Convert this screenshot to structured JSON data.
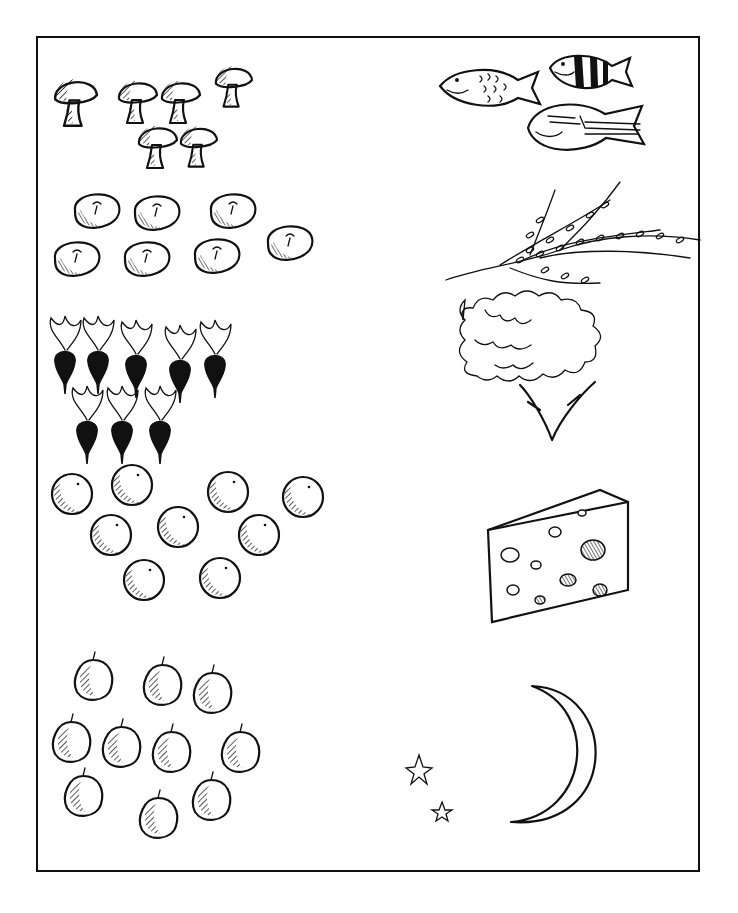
{
  "worksheet": {
    "title": "Counting picture worksheet",
    "ink_color": "#111111",
    "paper_color": "#ffffff",
    "left_column": [
      {
        "id": "mushrooms",
        "item": "mushroom",
        "count": 6,
        "positions": [
          [
            75,
            95
          ],
          [
            137,
            95
          ],
          [
            180,
            95
          ],
          [
            233,
            80
          ],
          [
            157,
            140
          ],
          [
            198,
            140
          ]
        ],
        "scale": [
          1.1,
          1.0,
          1.0,
          0.95,
          1.0,
          0.95
        ]
      },
      {
        "id": "tomatoes",
        "item": "tomato",
        "count": 8,
        "positions": [
          [
            97,
            210
          ],
          [
            157,
            212
          ],
          [
            233,
            210
          ],
          [
            77,
            258
          ],
          [
            147,
            258
          ],
          [
            217,
            255
          ],
          [
            290,
            242
          ]
        ]
      },
      {
        "id": "radishes",
        "item": "radish",
        "count": 8,
        "positions": [
          [
            65,
            358
          ],
          [
            98,
            358
          ],
          [
            136,
            362
          ],
          [
            180,
            367
          ],
          [
            215,
            362
          ],
          [
            87,
            428
          ],
          [
            122,
            428
          ],
          [
            160,
            428
          ]
        ]
      },
      {
        "id": "oranges",
        "item": "orange",
        "count": 9,
        "positions": [
          [
            72,
            494
          ],
          [
            132,
            485
          ],
          [
            228,
            492
          ],
          [
            303,
            497
          ],
          [
            111,
            535
          ],
          [
            178,
            527
          ],
          [
            259,
            535
          ],
          [
            144,
            580
          ],
          [
            220,
            578
          ]
        ]
      },
      {
        "id": "plums",
        "item": "plum",
        "count": 11,
        "positions": [
          [
            93,
            680
          ],
          [
            162,
            685
          ],
          [
            212,
            693
          ],
          [
            71,
            742
          ],
          [
            121,
            747
          ],
          [
            171,
            752
          ],
          [
            240,
            752
          ],
          [
            83,
            796
          ],
          [
            158,
            818
          ],
          [
            211,
            800
          ]
        ]
      }
    ],
    "right_column": [
      {
        "id": "fish",
        "item": "fish",
        "count": 3
      },
      {
        "id": "herbs",
        "item": "bunch of herbs",
        "count": 1
      },
      {
        "id": "cheese",
        "item": "wedge of cheese",
        "count": 1
      },
      {
        "id": "night-sky",
        "item": "moon and stars",
        "moon_count": 1,
        "star_count": 2
      }
    ]
  }
}
